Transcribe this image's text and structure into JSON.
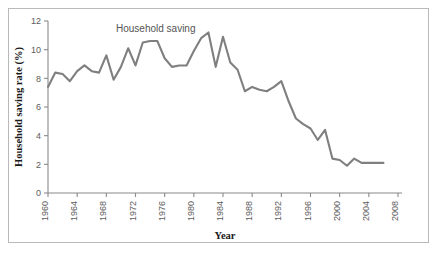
{
  "figure": {
    "border_color": "#b9b9b9",
    "background": "#ffffff"
  },
  "chart_data": {
    "type": "line",
    "title": "",
    "annotation": "Household saving",
    "xlabel": "Year",
    "ylabel": "Household saving rate (%)",
    "xlim": [
      1960,
      2008
    ],
    "ylim": [
      0,
      12
    ],
    "grid": false,
    "legend": "none",
    "line_color": "#7f7f7f",
    "axis_color": "#8a8a8a",
    "xticks": [
      1960,
      1964,
      1968,
      1972,
      1976,
      1980,
      1984,
      1988,
      1992,
      1996,
      2000,
      2004,
      2008
    ],
    "xtick_labels": [
      "1960",
      "1964",
      "1968",
      "1972",
      "1976",
      "1980",
      "1984",
      "1988",
      "1992",
      "1996",
      "2000",
      "2004",
      "2008"
    ],
    "xtick_rotation": 90,
    "yticks": [
      0,
      2,
      4,
      6,
      8,
      10,
      12
    ],
    "ytick_labels": [
      "0",
      "2",
      "4",
      "6",
      "8",
      "10",
      "12"
    ],
    "series": [
      {
        "name": "Household saving",
        "x": [
          1960,
          1961,
          1962,
          1963,
          1964,
          1965,
          1966,
          1967,
          1968,
          1969,
          1970,
          1971,
          1972,
          1973,
          1974,
          1975,
          1976,
          1977,
          1978,
          1979,
          1980,
          1981,
          1982,
          1983,
          1984,
          1985,
          1986,
          1987,
          1988,
          1989,
          1990,
          1991,
          1992,
          1993,
          1994,
          1995,
          1996,
          1997,
          1998,
          1999,
          2000,
          2001,
          2002,
          2003,
          2004,
          2005,
          2006
        ],
        "values": [
          7.4,
          8.4,
          8.3,
          7.8,
          8.5,
          8.9,
          8.5,
          8.4,
          9.6,
          7.9,
          8.8,
          10.1,
          8.9,
          10.5,
          10.6,
          10.6,
          9.4,
          8.8,
          8.9,
          8.9,
          9.9,
          10.8,
          11.2,
          8.8,
          10.9,
          9.1,
          8.6,
          7.1,
          7.4,
          7.2,
          7.1,
          7.4,
          7.8,
          6.4,
          5.2,
          4.8,
          4.5,
          3.7,
          4.4,
          2.4,
          2.3,
          1.9,
          2.4,
          2.1,
          2.1,
          2.1,
          2.1
        ]
      }
    ]
  }
}
